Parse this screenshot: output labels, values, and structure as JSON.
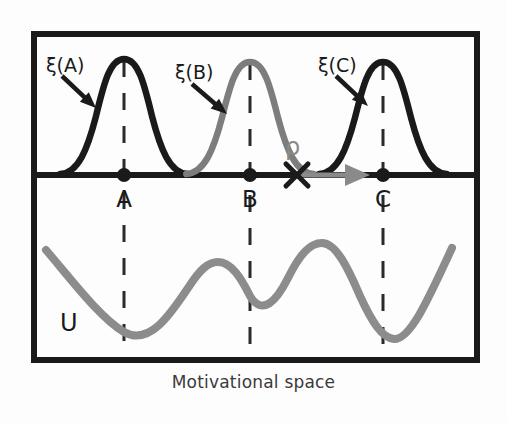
{
  "figure": {
    "caption": "Motivational space",
    "frame": {
      "x": 31,
      "y": 31,
      "width": 449,
      "height": 332,
      "stroke": "#1a1a1a",
      "stroke_width": 6
    },
    "divider_y": 175,
    "colors": {
      "dark": "#1a1a1a",
      "gray": "#878787",
      "background": "#fdfdfd",
      "caption": "#3a3a3a"
    }
  },
  "top_panel": {
    "name": "response-distribution-panel",
    "axis_label": "ξ",
    "peaks": [
      {
        "id": "A",
        "label": "ξ(A)",
        "center_x": 124,
        "apex_y": 59,
        "sigma": 26,
        "color": "#1a1a1a",
        "label_x": 46,
        "label_y": 66
      },
      {
        "id": "B",
        "label": "ξ(B)",
        "center_x": 250,
        "apex_y": 62,
        "sigma": 26,
        "color": "#7d7d7d",
        "label_x": 175,
        "label_y": 73
      },
      {
        "id": "C",
        "label": "ξ(C)",
        "center_x": 383,
        "apex_y": 62,
        "sigma": 26,
        "color": "#1a1a1a",
        "label_x": 318,
        "label_y": 66
      }
    ],
    "arrows": [
      {
        "name": "xi-a-pointer",
        "x1": 62,
        "y1": 76,
        "x2": 96,
        "y2": 108,
        "color": "#1a1a1a"
      },
      {
        "name": "xi-b-pointer",
        "x1": 192,
        "y1": 84,
        "x2": 227,
        "y2": 114,
        "color": "#1a1a1a"
      },
      {
        "name": "xi-c-pointer",
        "x1": 336,
        "y1": 76,
        "x2": 368,
        "y2": 106,
        "color": "#1a1a1a"
      }
    ],
    "rho": {
      "label": "ρ",
      "label_x": 291,
      "label_y": 148,
      "color": "#8a8a8a",
      "cross_x": 297,
      "cross_y": 175,
      "arrow_start_x": 300,
      "arrow_end_x": 368,
      "arrow_y": 175
    }
  },
  "axis_points": [
    {
      "id": "A",
      "label": "A",
      "x": 124,
      "y": 175,
      "label_y": 200
    },
    {
      "id": "B",
      "label": "B",
      "x": 250,
      "y": 175,
      "label_y": 200
    },
    {
      "id": "C",
      "label": "C",
      "x": 383,
      "y": 175,
      "label_y": 200
    }
  ],
  "dashed_guides": [
    {
      "id": "A",
      "x": 124,
      "y_top": 37,
      "y_bottom": 357
    },
    {
      "id": "B",
      "x": 250,
      "y_top": 37,
      "y_bottom": 357
    },
    {
      "id": "C",
      "x": 383,
      "y_top": 37,
      "y_bottom": 357
    }
  ],
  "bottom_panel": {
    "name": "utility-landscape-panel",
    "curve_label": "U",
    "curve_label_x": 60,
    "curve_label_y": 322,
    "curve_color": "#8c8c8c",
    "curve_width": 8,
    "path": "M 46,250 C 70,278 100,318 124,332 C 150,347 172,312 190,285 C 200,270 208,262 218,262 C 232,262 242,280 250,296 C 262,316 276,302 288,278 C 300,254 310,243 322,243 C 336,243 348,268 360,296 C 372,322 382,338 394,339 C 410,340 428,300 452,248",
    "extrema": [
      {
        "type": "min",
        "at": "A",
        "x": 124,
        "y": 332
      },
      {
        "type": "max",
        "x": 218,
        "y": 262
      },
      {
        "type": "min",
        "at": "B",
        "x": 250,
        "y": 296
      },
      {
        "type": "max",
        "x": 322,
        "y": 243
      },
      {
        "type": "min",
        "at": "C",
        "x": 394,
        "y": 339
      }
    ]
  },
  "chart_data": {
    "type": "line",
    "title": "",
    "xlabel": "Motivational space",
    "ylabel": "",
    "grid": false,
    "legend": "none",
    "series": [
      {
        "name": "ξ(A)",
        "type": "gaussian",
        "color": "#1a1a1a",
        "center": "A",
        "peak_height": 1.0
      },
      {
        "name": "ξ(B)",
        "type": "gaussian",
        "color": "#7d7d7d",
        "center": "B",
        "peak_height": 0.98
      },
      {
        "name": "ξ(C)",
        "type": "gaussian",
        "color": "#1a1a1a",
        "center": "C",
        "peak_height": 0.98
      },
      {
        "name": "U",
        "type": "potential-landscape",
        "color": "#8c8c8c",
        "minima_at": [
          "A",
          "B",
          "C"
        ],
        "minima_depth": [
          1.0,
          0.62,
          1.05
        ],
        "maxima_between": [
          0.38,
          0.12
        ]
      },
      {
        "name": "ρ",
        "type": "transition-arrow",
        "color": "#8a8a8a",
        "from": "cross-point",
        "to": "C"
      }
    ],
    "categories": [
      "A",
      "B",
      "C"
    ],
    "annotations": [
      "ξ(A)",
      "ξ(B)",
      "ξ(C)",
      "ρ",
      "U",
      "A",
      "B",
      "C"
    ]
  }
}
